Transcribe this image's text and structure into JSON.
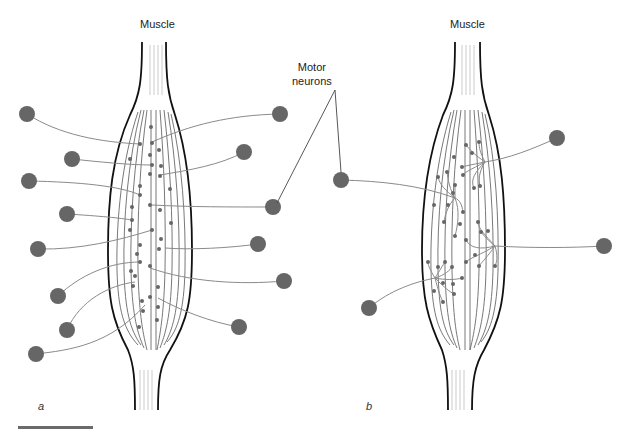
{
  "figure": {
    "panels": [
      {
        "id": "a",
        "letter": "a",
        "title": "Muscle",
        "description": "Small motor units: many motor neurons each innervating few muscle fibers",
        "neuron_count": 14,
        "neurons_left": [
          [
            27,
            114
          ],
          [
            72,
            159
          ],
          [
            29,
            181
          ],
          [
            67,
            214
          ],
          [
            38,
            249
          ],
          [
            58,
            296
          ],
          [
            67,
            330
          ],
          [
            36,
            354
          ]
        ],
        "neurons_right": [
          [
            280,
            114
          ],
          [
            244,
            152
          ],
          [
            273,
            207
          ],
          [
            258,
            244
          ],
          [
            284,
            281
          ],
          [
            239,
            327
          ]
        ]
      },
      {
        "id": "b",
        "letter": "b",
        "title": "Muscle",
        "description": "Large motor units: few motor neurons each innervating many muscle fibers",
        "neuron_count": 4,
        "neurons": [
          [
            341,
            180
          ],
          [
            557,
            138
          ],
          [
            604,
            246
          ],
          [
            369,
            308
          ]
        ]
      }
    ],
    "callout": {
      "line1": "Motor",
      "line2": "neurons"
    },
    "colors": {
      "neuron_fill": "#666666",
      "axon": "#8a8a8a",
      "muscle_outline": "#111111",
      "fiber": "#555555",
      "scale_bar": "#6b6b6b"
    }
  }
}
